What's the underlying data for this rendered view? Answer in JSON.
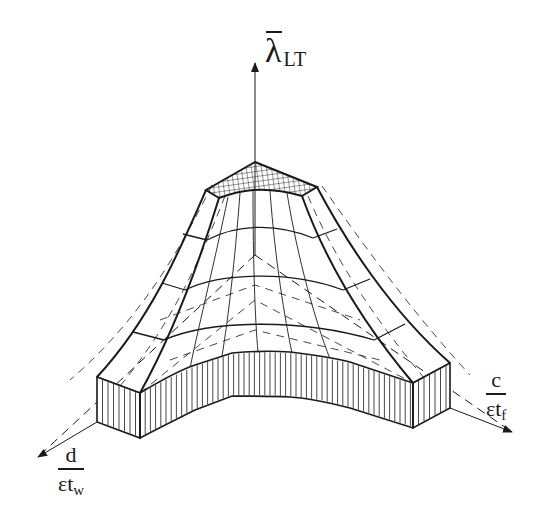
{
  "figure": {
    "type": "3d-surface-diagram"
  },
  "axes": {
    "vertical": {
      "symbol": "λ",
      "overbar": true,
      "subscript": "LT"
    },
    "left": {
      "numerator": "d",
      "denominator_main": "εt",
      "denominator_sub": "w"
    },
    "right": {
      "numerator": "c",
      "denominator_main": "εt",
      "denominator_sub": "f"
    }
  },
  "colors": {
    "ink": "#1a1a1a",
    "background": "#ffffff"
  }
}
